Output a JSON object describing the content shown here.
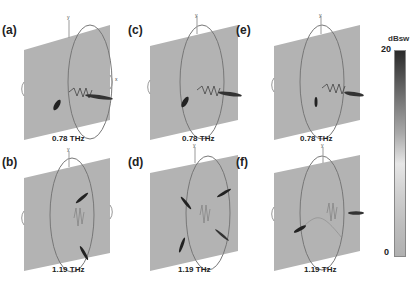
{
  "figure": {
    "panels": [
      {
        "label": "(a)",
        "frequency": "0.78 THz",
        "mode": "A"
      },
      {
        "label": "(b)",
        "frequency": "1.19 THz",
        "mode": "B"
      },
      {
        "label": "(c)",
        "frequency": "0.78 THz",
        "mode": "A"
      },
      {
        "label": "(d)",
        "frequency": "1.19 THz",
        "mode": "B"
      },
      {
        "label": "(e)",
        "frequency": "0.78 THz",
        "mode": "A"
      },
      {
        "label": "(f)",
        "frequency": "1.19 THz",
        "mode": "B"
      }
    ],
    "axis_labels": {
      "y": "y",
      "x": "x",
      "z": "z",
      "theta": "θ",
      "phi": "φ"
    },
    "colorbar": {
      "title": "dBsw",
      "max": "20",
      "min": "0",
      "colors": {
        "high": "#2a2a2a",
        "mid": "#e6e6e6",
        "low": "#b0b0b0"
      }
    },
    "plane_color": "#b3b3b3",
    "ring_color": "#777777"
  }
}
